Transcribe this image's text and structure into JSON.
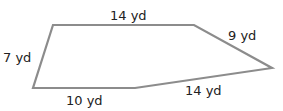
{
  "figure": {
    "shape": "pentagon",
    "stroke_color": "#8c8c8c",
    "stroke_width": 2.2,
    "vertices": [
      [
        53,
        25
      ],
      [
        194,
        25
      ],
      [
        272,
        68
      ],
      [
        135,
        88
      ],
      [
        33,
        88
      ]
    ],
    "points_attr": "53,25 194,25 272,68 135,88 33,88",
    "side_labels": {
      "top": "14 yd",
      "upper_right": "9 yd",
      "left": "7 yd",
      "bottom_left": "10 yd",
      "bottom_right": "14 yd"
    }
  }
}
